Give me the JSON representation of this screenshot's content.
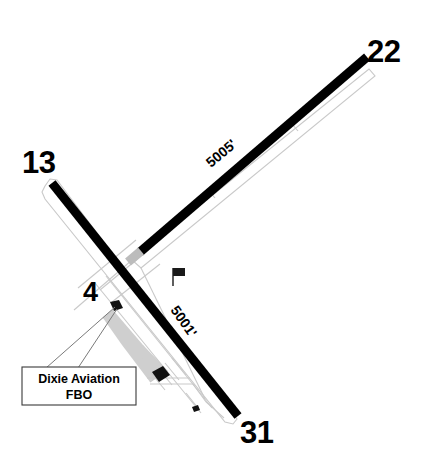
{
  "diagram": {
    "type": "airport-diagram",
    "background_color": "#ffffff",
    "runway_color": "#000000",
    "pavement_outline_color": "#c9c9c9",
    "apron_color": "#cfcfcf",
    "building_color": "#111111",
    "displaced_threshold_color": "#bcbcbc"
  },
  "runways": [
    {
      "id": "runway-13-31",
      "end_label_start": "13",
      "end_label_end": "31",
      "length_label": "5001'",
      "orientation_deg": 56
    },
    {
      "id": "runway-4-22",
      "end_label_start": "4",
      "end_label_end": "22",
      "length_label": "5005'",
      "orientation_deg": -46
    }
  ],
  "labels": {
    "rw13": "13",
    "rw31": "31",
    "rw4": "4",
    "rw22": "22",
    "length_13_31": "5001'",
    "length_4_22": "5005'"
  },
  "callout": {
    "line1": "Dixie Aviation",
    "line2": "FBO"
  },
  "symbols": {
    "windsock": "windsock-icon"
  }
}
